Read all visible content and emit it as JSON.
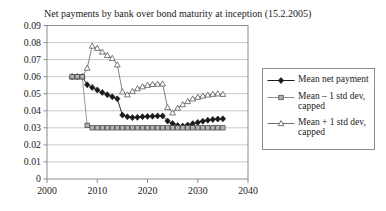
{
  "title": "Net payments by bank over bond maturity at inception (15.2.2005)",
  "chart_data": {
    "type": "line",
    "title": "Net payments by bank over bond maturity at inception (15.2.2005)",
    "grid": "horizontal",
    "legend_position": "right",
    "x_axis": {
      "min": 2000,
      "max": 2040,
      "tick_values": [
        2000,
        2010,
        2020,
        2030,
        2040
      ],
      "tick_labels": [
        "2000",
        "2010",
        "2020",
        "2030",
        "2040"
      ]
    },
    "y_axis": {
      "min": 0,
      "max": 0.09,
      "tick_values": [
        0.09,
        0.08,
        0.07,
        0.06,
        0.05,
        0.04,
        0.03,
        0.02,
        0.01,
        0
      ],
      "tick_labels": [
        "0.09",
        "0.08",
        "0.07",
        "0.06",
        "0.05",
        "0.04",
        "0.03",
        "0.02",
        "0.01",
        "0"
      ]
    },
    "years": [
      2005,
      2006,
      2007,
      2008,
      2009,
      2010,
      2011,
      2012,
      2013,
      2014,
      2015,
      2016,
      2017,
      2018,
      2019,
      2020,
      2021,
      2022,
      2023,
      2024,
      2025,
      2026,
      2027,
      2028,
      2029,
      2030,
      2031,
      2032,
      2033,
      2034,
      2035
    ],
    "series": [
      {
        "name": "Mean net payment",
        "legend_label": "Mean net payment",
        "marker": "diamond",
        "line_color": "#1a1a1a",
        "marker_fill": "#1a1a1a",
        "marker_stroke": "#1a1a1a",
        "values": [
          0.06,
          0.06,
          0.06,
          0.0553,
          0.0537,
          0.0522,
          0.0507,
          0.0494,
          0.0482,
          0.047,
          0.0375,
          0.0365,
          0.036,
          0.0362,
          0.0365,
          0.0367,
          0.0368,
          0.037,
          0.037,
          0.034,
          0.0325,
          0.0313,
          0.031,
          0.0316,
          0.0324,
          0.0332,
          0.0339,
          0.0345,
          0.0349,
          0.0352,
          0.0353
        ]
      },
      {
        "name": "Mean - 1 std dev, capped",
        "legend_label": "Mean – 1 std dev,\ncapped",
        "marker": "square",
        "line_color": "#8c8c8c",
        "marker_fill": "#b3b3b3",
        "marker_stroke": "#4d4d4d",
        "values": [
          0.06,
          0.06,
          0.06,
          0.0315,
          0.03,
          0.03,
          0.03,
          0.03,
          0.03,
          0.03,
          0.03,
          0.03,
          0.03,
          0.03,
          0.03,
          0.03,
          0.03,
          0.03,
          0.03,
          0.03,
          0.03,
          0.03,
          0.03,
          0.03,
          0.03,
          0.03,
          0.03,
          0.03,
          0.03,
          0.03,
          0.03
        ]
      },
      {
        "name": "Mean + 1 std dev, capped",
        "legend_label": "Mean + 1 std dev,\ncapped",
        "marker": "triangle",
        "line_color": "#737373",
        "marker_fill": "#ffffff",
        "marker_stroke": "#595959",
        "values": [
          0.06,
          0.06,
          0.06,
          0.065,
          0.078,
          0.0767,
          0.0745,
          0.0725,
          0.0708,
          0.067,
          0.0512,
          0.0494,
          0.0515,
          0.053,
          0.0542,
          0.055,
          0.0555,
          0.0557,
          0.0558,
          0.042,
          0.0388,
          0.0416,
          0.0437,
          0.0455,
          0.047,
          0.048,
          0.0487,
          0.0493,
          0.0497,
          0.05,
          0.0497
        ]
      }
    ],
    "colors": {
      "background": "#ffffff",
      "gridline": "#c9c9c9",
      "frame": "#8c8c8c",
      "text": "#1a1a1a"
    }
  }
}
